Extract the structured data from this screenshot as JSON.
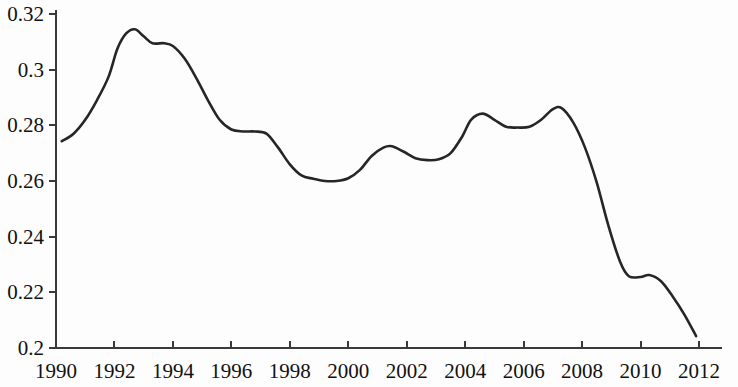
{
  "chart_data": {
    "type": "line",
    "title": "",
    "subtitle": "",
    "xlabel": "",
    "ylabel": "",
    "xlim": [
      1990,
      2012
    ],
    "ylim": [
      0.2,
      0.32
    ],
    "grid": false,
    "legend": null,
    "x_ticks": [
      "1990",
      "1992",
      "1994",
      "1996",
      "1998",
      "2000",
      "2002",
      "2004",
      "2006",
      "2008",
      "2010",
      "2012"
    ],
    "x_tick_values": [
      1990,
      1992,
      1994,
      1996,
      1998,
      2000,
      2002,
      2004,
      2006,
      2008,
      2010,
      2012
    ],
    "y_ticks": [
      "0.2",
      "0.22",
      "0.24",
      "0.26",
      "0.28",
      "0.3",
      "0.32"
    ],
    "y_tick_values": [
      0.2,
      0.22,
      0.24,
      0.26,
      0.28,
      0.3,
      0.32
    ],
    "series": [
      {
        "name": "",
        "color": "#262626",
        "x": [
          1990.2,
          1990.6,
          1991.0,
          1991.4,
          1991.8,
          1992.1,
          1992.4,
          1992.7,
          1993.0,
          1993.3,
          1993.7,
          1994.0,
          1994.4,
          1994.8,
          1995.2,
          1995.6,
          1996.0,
          1996.4,
          1996.8,
          1997.2,
          1997.6,
          1998.0,
          1998.4,
          1998.8,
          1999.2,
          1999.6,
          2000.0,
          2000.4,
          2000.8,
          2001.2,
          2001.5,
          2001.9,
          2002.3,
          2002.7,
          2003.1,
          2003.5,
          2003.9,
          2004.2,
          2004.6,
          2005.0,
          2005.4,
          2005.8,
          2006.2,
          2006.6,
          2007.0,
          2007.3,
          2007.7,
          2008.1,
          2008.5,
          2008.9,
          2009.3,
          2009.6,
          2010.0,
          2010.3,
          2010.7,
          2011.1,
          2011.5,
          2011.9
        ],
        "y": [
          0.2743,
          0.277,
          0.282,
          0.289,
          0.2975,
          0.3075,
          0.313,
          0.3145,
          0.312,
          0.3095,
          0.3095,
          0.3085,
          0.304,
          0.297,
          0.289,
          0.282,
          0.2785,
          0.2778,
          0.2778,
          0.277,
          0.272,
          0.266,
          0.262,
          0.2608,
          0.26,
          0.26,
          0.261,
          0.264,
          0.269,
          0.272,
          0.2725,
          0.2705,
          0.2682,
          0.2675,
          0.2678,
          0.27,
          0.276,
          0.282,
          0.2842,
          0.282,
          0.2795,
          0.2792,
          0.2795,
          0.282,
          0.2858,
          0.2862,
          0.281,
          0.272,
          0.2595,
          0.244,
          0.231,
          0.2258,
          0.2255,
          0.2262,
          0.224,
          0.2185,
          0.212,
          0.2043
        ]
      }
    ],
    "data_points_by_year": [
      {
        "year": 1990,
        "value": 0.2743
      },
      {
        "year": 1991,
        "value": 0.282
      },
      {
        "year": 1992,
        "value": 0.311
      },
      {
        "year": 1993,
        "value": 0.312
      },
      {
        "year": 1994,
        "value": 0.3085
      },
      {
        "year": 1995,
        "value": 0.289
      },
      {
        "year": 1996,
        "value": 0.2785
      },
      {
        "year": 1997,
        "value": 0.277
      },
      {
        "year": 1998,
        "value": 0.266
      },
      {
        "year": 1999,
        "value": 0.26
      },
      {
        "year": 2000,
        "value": 0.261
      },
      {
        "year": 2001,
        "value": 0.272
      },
      {
        "year": 2002,
        "value": 0.2682
      },
      {
        "year": 2003,
        "value": 0.2678
      },
      {
        "year": 2004,
        "value": 0.2842
      },
      {
        "year": 2005,
        "value": 0.2795
      },
      {
        "year": 2006,
        "value": 0.2795
      },
      {
        "year": 2007,
        "value": 0.2858
      },
      {
        "year": 2008,
        "value": 0.272
      },
      {
        "year": 2009,
        "value": 0.231
      },
      {
        "year": 2010,
        "value": 0.2255
      },
      {
        "year": 2011,
        "value": 0.2185
      },
      {
        "year": 2012,
        "value": 0.2043
      }
    ],
    "peak": {
      "year": 1992.7,
      "value": 0.3145
    },
    "trough": {
      "year": 2011.9,
      "value": 0.2043
    }
  }
}
